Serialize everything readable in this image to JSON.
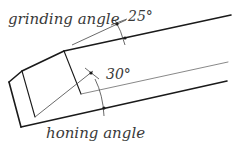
{
  "diagram": {
    "labels": {
      "grinding_angle": "grinding angle",
      "grinding_value": "25°",
      "honing_angle": "honing angle",
      "honing_value": "30°"
    },
    "colors": {
      "stroke": "#1a1a1a",
      "thin": "#444444",
      "text": "#3a3a3a"
    }
  }
}
